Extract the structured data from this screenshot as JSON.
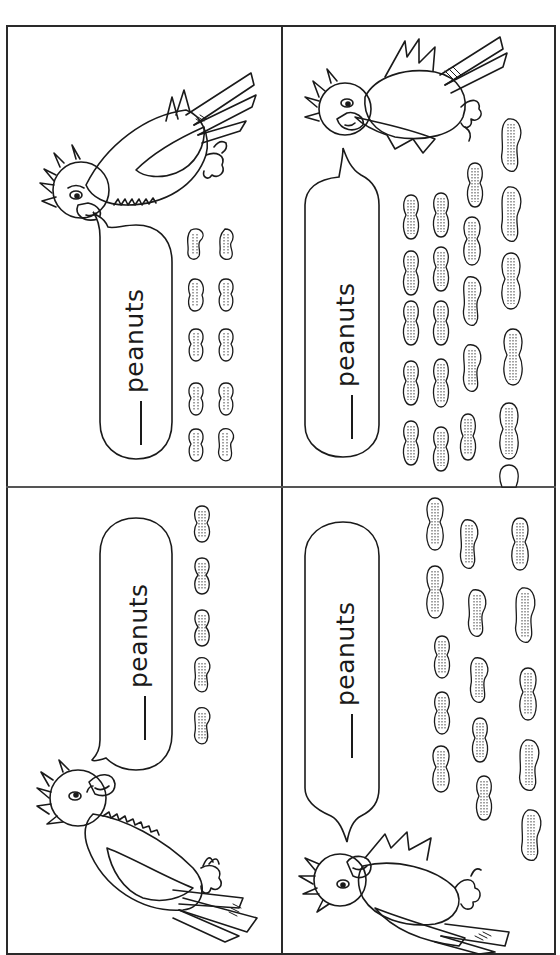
{
  "worksheet": {
    "title": "Parrot peanut counting worksheet",
    "layout": "2x2 grid of panels, content rotated 90 degrees",
    "colors": {
      "ink": "#1a1a1a",
      "paper": "#ffffff",
      "border": "#2a2a2a"
    },
    "panels": [
      {
        "id": "top-left",
        "bubble": {
          "blank": "____",
          "word": "peanuts"
        },
        "peanut_count": 10,
        "peanut_layout": "2 columns x 5 rows"
      },
      {
        "id": "top-right",
        "bubble": {
          "blank": "____",
          "word": "peanuts"
        },
        "peanut_count": 21,
        "peanut_layout": "columns of 5, 5, 5, 6"
      },
      {
        "id": "bottom-left",
        "bubble": {
          "blank": "____",
          "word": "peanuts"
        },
        "peanut_count": 5,
        "peanut_layout": "1 column x 5 rows"
      },
      {
        "id": "bottom-right",
        "bubble": {
          "blank": "____",
          "word": "peanuts"
        },
        "peanut_count": 15,
        "peanut_layout": "3 columns x 5 rows"
      }
    ]
  }
}
